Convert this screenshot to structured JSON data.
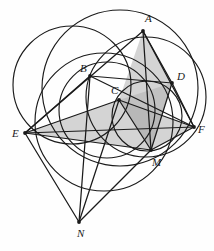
{
  "figure": {
    "caption_fragment": "",
    "background_color": "#fefefe",
    "stroke_color": "#1a1a1a",
    "shade_color": "#b0b0b0",
    "shade_opacity": 0.55,
    "width": 214,
    "height": 251,
    "labels": {
      "A": "A",
      "B": "B",
      "C": "C",
      "D": "D",
      "E": "E",
      "F": "F",
      "M": "M",
      "N": "N"
    },
    "points": {
      "A": {
        "x": 143,
        "y": 31
      },
      "B": {
        "x": 90,
        "y": 76
      },
      "C": {
        "x": 119,
        "y": 100
      },
      "D": {
        "x": 172,
        "y": 83
      },
      "E": {
        "x": 25,
        "y": 133
      },
      "F": {
        "x": 194,
        "y": 127
      },
      "M": {
        "x": 151,
        "y": 150
      },
      "N": {
        "x": 79,
        "y": 222
      }
    },
    "label_offsets": {
      "A": {
        "x": 145,
        "y": 22
      },
      "B": {
        "x": 80,
        "y": 72
      },
      "C": {
        "x": 111,
        "y": 94
      },
      "D": {
        "x": 177,
        "y": 80
      },
      "E": {
        "x": 12,
        "y": 137
      },
      "F": {
        "x": 198,
        "y": 133
      },
      "M": {
        "x": 152,
        "y": 166
      },
      "N": {
        "x": 77,
        "y": 237
      }
    },
    "circles": [
      {
        "name": "circle-large-left",
        "cx": 72,
        "cy": 85,
        "r": 59
      },
      {
        "name": "circle-through-bcm",
        "cx": 107,
        "cy": 110,
        "r": 48
      },
      {
        "name": "circle-right-big",
        "cx": 146,
        "cy": 97,
        "r": 60
      },
      {
        "name": "circle-small-cdm",
        "cx": 147,
        "cy": 116,
        "r": 35
      },
      {
        "name": "circle-lower-wide",
        "cx": 104,
        "cy": 122,
        "r": 69
      },
      {
        "name": "circle-ae-arc",
        "cx": 120,
        "cy": 88,
        "r": 78
      }
    ],
    "segments": [
      {
        "name": "segment-A-E",
        "from": "A",
        "to": "E"
      },
      {
        "name": "segment-A-M",
        "from": "A",
        "to": "M"
      },
      {
        "name": "segment-A-D",
        "from": "A",
        "to": "D"
      },
      {
        "name": "segment-A-F",
        "from": "A",
        "to": "F"
      },
      {
        "name": "segment-B-D",
        "from": "B",
        "to": "D"
      },
      {
        "name": "segment-B-F",
        "from": "B",
        "to": "F"
      },
      {
        "name": "segment-B-N",
        "from": "B",
        "to": "N"
      },
      {
        "name": "segment-B-E",
        "from": "B",
        "to": "E"
      },
      {
        "name": "segment-C-E",
        "from": "C",
        "to": "E"
      },
      {
        "name": "segment-C-F",
        "from": "C",
        "to": "F"
      },
      {
        "name": "segment-C-M",
        "from": "C",
        "to": "M"
      },
      {
        "name": "segment-C-N",
        "from": "C",
        "to": "N"
      },
      {
        "name": "segment-D-M",
        "from": "D",
        "to": "M"
      },
      {
        "name": "segment-D-F",
        "from": "D",
        "to": "F"
      },
      {
        "name": "segment-E-M",
        "from": "E",
        "to": "M"
      },
      {
        "name": "segment-E-F",
        "from": "E",
        "to": "F"
      },
      {
        "name": "segment-E-N",
        "from": "E",
        "to": "N"
      },
      {
        "name": "segment-M-F",
        "from": "M",
        "to": "F"
      },
      {
        "name": "segment-M-N",
        "from": "M",
        "to": "N"
      }
    ],
    "shaded_polygons": [
      {
        "name": "shaded-triangle-ecf",
        "vertices": [
          "E",
          "C",
          "F"
        ]
      },
      {
        "name": "shaded-triangle-adm",
        "vertices": [
          "A",
          "D",
          "M"
        ]
      },
      {
        "name": "shaded-triangle-acm",
        "vertices": [
          "A",
          "C",
          "M"
        ]
      },
      {
        "name": "shaded-triangle-emf",
        "vertices": [
          "E",
          "M",
          "F"
        ]
      },
      {
        "name": "shaded-triangle-cdm",
        "vertices": [
          "C",
          "D",
          "M"
        ]
      }
    ],
    "vertex_dot_radius": 1.9
  }
}
